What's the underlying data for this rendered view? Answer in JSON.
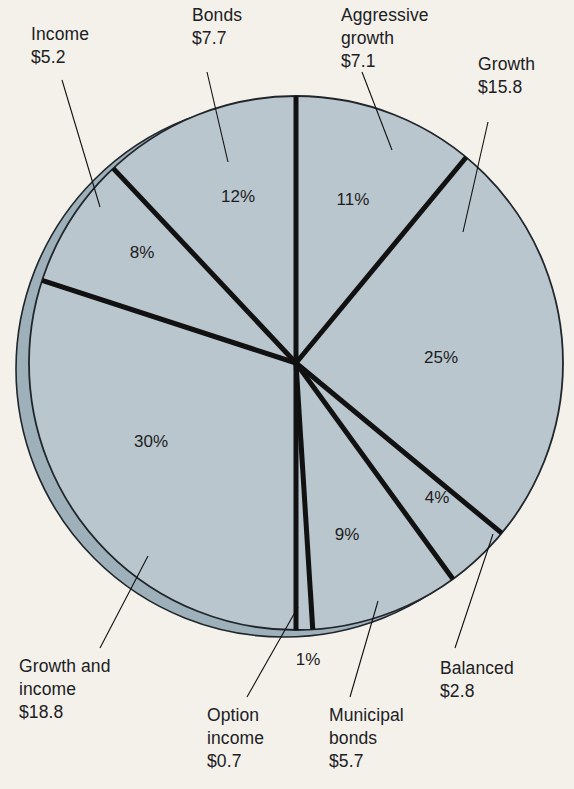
{
  "figure": {
    "background_color": "#f3f1ea",
    "pie_fill_color": "#b9c6cd",
    "pie_side_color": "#9eb0ba",
    "divider_color": "#111111",
    "text_color": "#20201f"
  },
  "chart_data": {
    "type": "pie",
    "title": "",
    "subtitle": "",
    "xlabel": "",
    "ylabel": "",
    "legend_position": "callout-labels",
    "grid": false,
    "value_unit": "$ billions",
    "total": 63.8,
    "categories": [
      "Aggressive growth",
      "Growth",
      "Balanced",
      "Municipal bonds",
      "Option income",
      "Growth and income",
      "Income",
      "Bonds"
    ],
    "values": [
      7.1,
      15.8,
      2.8,
      5.7,
      0.7,
      18.8,
      5.2,
      7.7
    ],
    "percentages": [
      11,
      25,
      4,
      9,
      1,
      30,
      8,
      12
    ],
    "slices": [
      {
        "name": "aggressive-growth",
        "label": "Aggressive\ngrowth",
        "amount": "$7.1",
        "percent_text": "11%",
        "percent": 11,
        "value": 7.1,
        "start_angle": 0,
        "end_angle": 39.6,
        "pct_x": 353,
        "pct_y": 205,
        "label_x": 341,
        "label_y": 4,
        "leader": [
          362,
          72,
          392,
          150
        ]
      },
      {
        "name": "growth",
        "label": "Growth",
        "amount": "$15.8",
        "percent_text": "25%",
        "percent": 25,
        "value": 15.8,
        "start_angle": 39.6,
        "end_angle": 129.6,
        "pct_x": 441,
        "pct_y": 363,
        "label_x": 478,
        "label_y": 53,
        "leader": [
          488,
          122,
          463,
          232
        ]
      },
      {
        "name": "balanced",
        "label": "Balanced",
        "amount": "$2.8",
        "percent_text": "4%",
        "percent": 4,
        "value": 2.8,
        "start_angle": 129.6,
        "end_angle": 144.0,
        "pct_x": 437,
        "pct_y": 503,
        "label_x": 440,
        "label_y": 657,
        "leader": [
          455,
          648,
          493,
          534
        ]
      },
      {
        "name": "municipal-bonds",
        "label": "Municipal\nbonds",
        "amount": "$5.7",
        "percent_text": "9%",
        "percent": 9,
        "value": 5.7,
        "start_angle": 144.0,
        "end_angle": 176.4,
        "pct_x": 347,
        "pct_y": 540,
        "label_x": 329,
        "label_y": 704,
        "leader": [
          350,
          697,
          378,
          601
        ]
      },
      {
        "name": "option-income",
        "label": "Option\nincome",
        "amount": "$0.7",
        "percent_text": "1%",
        "percent": 1,
        "value": 0.7,
        "start_angle": 176.4,
        "end_angle": 180.0,
        "pct_x": 308,
        "pct_y": 665,
        "label_x": 207,
        "label_y": 704,
        "leader": [
          247,
          697,
          298,
          607
        ]
      },
      {
        "name": "growth-and-income",
        "label": "Growth and\nincome",
        "amount": "$18.8",
        "percent_text": "30%",
        "percent": 30,
        "value": 18.8,
        "start_angle": 180.0,
        "end_angle": 288.0,
        "pct_x": 151,
        "pct_y": 447,
        "label_x": 19,
        "label_y": 655,
        "leader": [
          100,
          648,
          148,
          556
        ]
      },
      {
        "name": "income",
        "label": "Income",
        "amount": "$5.2",
        "percent_text": "8%",
        "percent": 8,
        "value": 5.2,
        "start_angle": 288.0,
        "end_angle": 316.8,
        "pct_x": 142,
        "pct_y": 258,
        "label_x": 31,
        "label_y": 23,
        "leader": [
          62,
          80,
          100,
          207
        ]
      },
      {
        "name": "bonds",
        "label": "Bonds",
        "amount": "$7.7",
        "percent_text": "12%",
        "percent": 12,
        "value": 7.7,
        "start_angle": 316.8,
        "end_angle": 360.0,
        "pct_x": 238,
        "pct_y": 202,
        "label_x": 192,
        "label_y": 4,
        "leader": [
          207,
          72,
          228,
          162
        ]
      }
    ]
  }
}
